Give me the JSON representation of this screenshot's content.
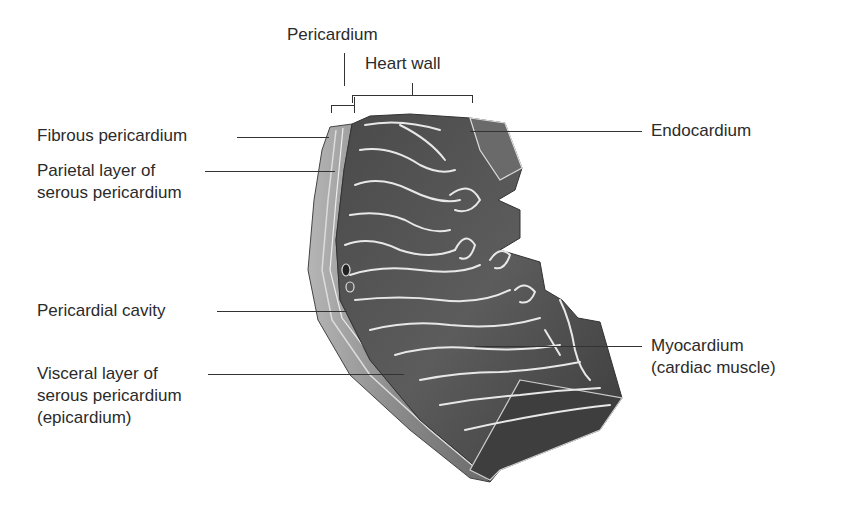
{
  "diagram": {
    "colors": {
      "background": "#ffffff",
      "text": "#2b2b2b",
      "leader_line": "#333333",
      "muscle_dark": "#3c3c3c",
      "muscle_mid": "#5e5e5e",
      "highlight": "#e6e6e6"
    },
    "top_labels": {
      "pericardium": "Pericardium",
      "heart_wall": "Heart wall"
    },
    "left_labels": [
      {
        "id": "fibrous",
        "lines": [
          "Fibrous pericardium"
        ]
      },
      {
        "id": "parietal",
        "lines": [
          "Parietal layer of",
          "serous pericardium"
        ]
      },
      {
        "id": "cavity",
        "lines": [
          "Pericardial cavity"
        ]
      },
      {
        "id": "visceral",
        "lines": [
          "Visceral layer of",
          "serous pericardium",
          "(epicardium)"
        ]
      }
    ],
    "right_labels": [
      {
        "id": "endocardium",
        "lines": [
          "Endocardium"
        ]
      },
      {
        "id": "myocardium",
        "lines": [
          "Myocardium",
          "(cardiac muscle)"
        ]
      }
    ]
  }
}
